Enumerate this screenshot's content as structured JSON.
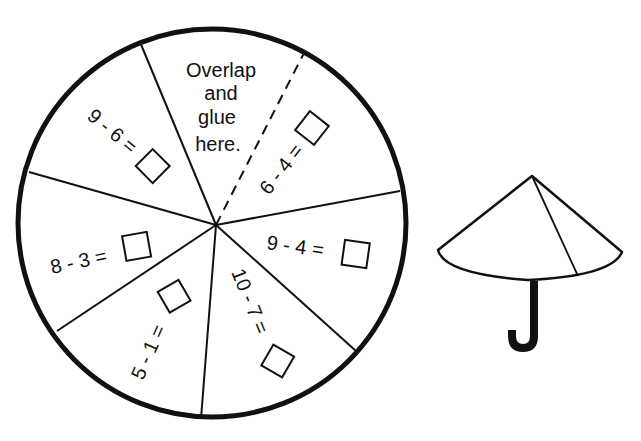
{
  "worksheet": {
    "title": "Umbrella subtraction spinner",
    "colors": {
      "ink": "#111111",
      "paper": "#ffffff"
    },
    "wheel": {
      "center": [
        216,
        225
      ],
      "radius": 195,
      "glue_area": {
        "lines": [
          "Overlap",
          "and",
          "glue",
          "here."
        ]
      },
      "problems": [
        {
          "id": "p1",
          "expression": "6 - 4 =",
          "answer_box": "empty"
        },
        {
          "id": "p2",
          "expression": "9 - 4 =",
          "answer_box": "empty"
        },
        {
          "id": "p3",
          "expression": "10 - 7 =",
          "answer_box": "empty"
        },
        {
          "id": "p4",
          "expression": "5 - 1 =",
          "answer_box": "empty"
        },
        {
          "id": "p5",
          "expression": "8 - 3 =",
          "answer_box": "empty"
        },
        {
          "id": "p6",
          "expression": "9 - 6 =",
          "answer_box": "empty"
        }
      ]
    },
    "umbrella": {
      "description": "Assembled cone umbrella with J-shaped handle"
    }
  }
}
